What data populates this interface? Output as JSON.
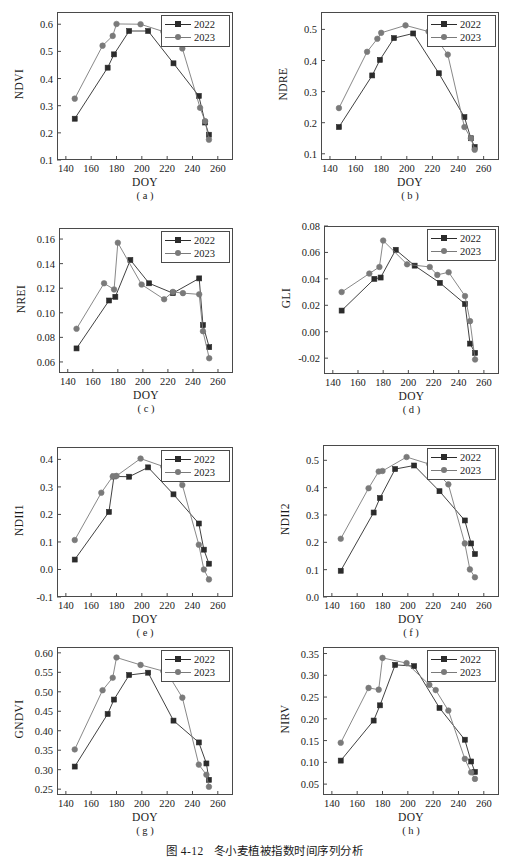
{
  "figure": {
    "caption_number": "图 4-12",
    "caption_text": "冬小麦植被指数时间序列分析",
    "xlabel": "DOY",
    "legend": {
      "series_2022": "2022",
      "series_2023": "2023"
    },
    "colors": {
      "series_2022": "#2b2b2b",
      "series_2023": "#7a7a7a",
      "axis": "#4a4a4a",
      "background": "#ffffff"
    }
  },
  "chart_data": [
    {
      "type": "line",
      "panel": "( a )",
      "title": "",
      "ylabel": "NDVI",
      "xlabel": "DOY",
      "xlim": [
        133,
        272
      ],
      "ylim": [
        0.1,
        0.645
      ],
      "xticks": [
        140,
        160,
        180,
        200,
        220,
        240,
        260
      ],
      "yticks": [
        0.1,
        0.2,
        0.3,
        0.4,
        0.5,
        0.6
      ],
      "ytick_labels": [
        "0.1",
        "0.2",
        "0.3",
        "0.4",
        "0.5",
        "0.6"
      ],
      "grid": false,
      "legend_position": "top-right",
      "series": [
        {
          "name": "2022",
          "marker": "square",
          "x": [
            147,
            173,
            178,
            190,
            205,
            225,
            245,
            250,
            253
          ],
          "values": [
            0.252,
            0.44,
            0.489,
            0.575,
            0.575,
            0.456,
            0.336,
            0.238,
            0.193
          ]
        },
        {
          "name": "2023",
          "marker": "circle",
          "x": [
            147,
            169,
            177,
            180,
            199,
            217,
            222,
            232,
            246,
            250,
            253
          ],
          "values": [
            0.326,
            0.521,
            0.557,
            0.601,
            0.6,
            0.573,
            0.559,
            0.511,
            0.292,
            0.243,
            0.175
          ]
        }
      ]
    },
    {
      "type": "line",
      "panel": "( b )",
      "title": "",
      "ylabel": "NDRE",
      "xlabel": "DOY",
      "xlim": [
        133,
        272
      ],
      "ylim": [
        0.08,
        0.556
      ],
      "xticks": [
        140,
        160,
        180,
        200,
        220,
        240,
        260
      ],
      "yticks": [
        0.1,
        0.2,
        0.3,
        0.4,
        0.5
      ],
      "ytick_labels": [
        "0.1",
        "0.2",
        "0.3",
        "0.4",
        "0.5"
      ],
      "grid": false,
      "legend_position": "top-right",
      "series": [
        {
          "name": "2022",
          "marker": "square",
          "x": [
            147,
            173,
            179,
            190,
            205,
            225,
            245,
            250,
            253
          ],
          "values": [
            0.186,
            0.352,
            0.402,
            0.472,
            0.487,
            0.359,
            0.218,
            0.15,
            0.122
          ]
        },
        {
          "name": "2023",
          "marker": "circle",
          "x": [
            147,
            169,
            177,
            180,
            199,
            217,
            222,
            232,
            245,
            250,
            253
          ],
          "values": [
            0.247,
            0.428,
            0.47,
            0.489,
            0.513,
            0.493,
            0.476,
            0.419,
            0.186,
            0.15,
            0.113
          ]
        }
      ]
    },
    {
      "type": "line",
      "panel": "( c )",
      "title": "",
      "ylabel": "NREI",
      "xlabel": "DOY",
      "xlim": [
        133,
        272
      ],
      "ylim": [
        0.051,
        0.169
      ],
      "xticks": [
        140,
        160,
        180,
        200,
        220,
        240,
        260
      ],
      "yticks": [
        0.06,
        0.08,
        0.1,
        0.12,
        0.14,
        0.16
      ],
      "ytick_labels": [
        "0.06",
        "0.08",
        "0.10",
        "0.12",
        "0.14",
        "0.16"
      ],
      "grid": false,
      "legend_position": "top-right",
      "series": [
        {
          "name": "2022",
          "marker": "square",
          "x": [
            147,
            173,
            178,
            190,
            205,
            224,
            245,
            248,
            253
          ],
          "values": [
            0.071,
            0.11,
            0.113,
            0.143,
            0.124,
            0.116,
            0.128,
            0.09,
            0.072
          ]
        },
        {
          "name": "2023",
          "marker": "circle",
          "x": [
            147,
            169,
            177,
            180,
            199,
            217,
            224,
            232,
            245,
            248,
            253
          ],
          "values": [
            0.087,
            0.124,
            0.119,
            0.157,
            0.123,
            0.111,
            0.117,
            0.116,
            0.115,
            0.085,
            0.063
          ]
        }
      ]
    },
    {
      "type": "line",
      "panel": "( d )",
      "title": "",
      "ylabel": "GLI",
      "xlabel": "DOY",
      "xlim": [
        133,
        272
      ],
      "ylim": [
        -0.032,
        0.08
      ],
      "xticks": [
        140,
        160,
        180,
        200,
        220,
        240,
        260
      ],
      "yticks": [
        -0.02,
        0.0,
        0.02,
        0.04,
        0.06,
        0.08
      ],
      "ytick_labels": [
        "-0.02",
        "0.00",
        "0.02",
        "0.04",
        "0.06",
        "0.08"
      ],
      "grid": false,
      "legend_position": "top-right",
      "series": [
        {
          "name": "2022",
          "marker": "square",
          "x": [
            147,
            173,
            178,
            190,
            205,
            225,
            245,
            249,
            253
          ],
          "values": [
            0.016,
            0.04,
            0.041,
            0.062,
            0.05,
            0.037,
            0.021,
            -0.009,
            -0.016
          ]
        },
        {
          "name": "2023",
          "marker": "circle",
          "x": [
            147,
            169,
            177,
            180,
            199,
            217,
            223,
            232,
            245,
            249,
            253
          ],
          "values": [
            0.03,
            0.044,
            0.049,
            0.069,
            0.051,
            0.049,
            0.043,
            0.045,
            0.027,
            0.008,
            -0.021
          ]
        }
      ]
    },
    {
      "type": "line",
      "panel": "( e )",
      "title": "",
      "ylabel": "NDII1",
      "xlabel": "DOY",
      "xlim": [
        133,
        272
      ],
      "ylim": [
        -0.1,
        0.445
      ],
      "xticks": [
        140,
        160,
        180,
        200,
        220,
        240,
        260
      ],
      "yticks": [
        -0.1,
        0.0,
        0.1,
        0.2,
        0.3,
        0.4
      ],
      "ytick_labels": [
        "-0.1",
        "0.0",
        "0.1",
        "0.2",
        "0.3",
        "0.4"
      ],
      "grid": false,
      "legend_position": "top-right",
      "series": [
        {
          "name": "2022",
          "marker": "square",
          "x": [
            147,
            174,
            178,
            190,
            205,
            225,
            245,
            249,
            253
          ],
          "values": [
            0.036,
            0.209,
            0.338,
            0.337,
            0.371,
            0.273,
            0.167,
            0.072,
            0.021
          ]
        },
        {
          "name": "2023",
          "marker": "circle",
          "x": [
            147,
            168,
            177,
            180,
            199,
            217,
            222,
            232,
            245,
            249,
            253
          ],
          "values": [
            0.107,
            0.279,
            0.338,
            0.34,
            0.403,
            0.374,
            0.358,
            0.307,
            0.09,
            0.0,
            -0.036
          ]
        }
      ]
    },
    {
      "type": "line",
      "panel": "( f )",
      "title": "",
      "ylabel": "NDII2",
      "xlabel": "DOY",
      "xlim": [
        133,
        272
      ],
      "ylim": [
        0.0,
        0.556
      ],
      "xticks": [
        140,
        160,
        180,
        200,
        220,
        240,
        260
      ],
      "yticks": [
        0.0,
        0.1,
        0.2,
        0.3,
        0.4,
        0.5
      ],
      "ytick_labels": [
        "0.0",
        "0.1",
        "0.2",
        "0.3",
        "0.4",
        "0.5"
      ],
      "grid": false,
      "legend_position": "top-right",
      "series": [
        {
          "name": "2022",
          "marker": "square",
          "x": [
            147,
            173,
            178,
            190,
            205,
            225,
            245,
            250,
            253
          ],
          "values": [
            0.096,
            0.309,
            0.362,
            0.468,
            0.481,
            0.387,
            0.28,
            0.196,
            0.157
          ]
        },
        {
          "name": "2023",
          "marker": "circle",
          "x": [
            147,
            169,
            177,
            180,
            199,
            217,
            222,
            232,
            245,
            249,
            253
          ],
          "values": [
            0.213,
            0.398,
            0.459,
            0.461,
            0.512,
            0.486,
            0.459,
            0.412,
            0.196,
            0.101,
            0.072
          ]
        }
      ]
    },
    {
      "type": "line",
      "panel": "( g )",
      "title": "",
      "ylabel": "GNDVI",
      "xlabel": "DOY",
      "xlim": [
        133,
        272
      ],
      "ylim": [
        0.235,
        0.615
      ],
      "xticks": [
        140,
        160,
        180,
        200,
        220,
        240,
        260
      ],
      "yticks": [
        0.25,
        0.3,
        0.35,
        0.4,
        0.45,
        0.5,
        0.55,
        0.6
      ],
      "ytick_labels": [
        "0.25",
        "0.30",
        "0.35",
        "0.40",
        "0.45",
        "0.50",
        "0.55",
        "0.60"
      ],
      "grid": false,
      "legend_position": "top-right",
      "series": [
        {
          "name": "2022",
          "marker": "square",
          "x": [
            147,
            173,
            178,
            190,
            205,
            225,
            245,
            251,
            253
          ],
          "values": [
            0.308,
            0.443,
            0.48,
            0.543,
            0.549,
            0.426,
            0.37,
            0.316,
            0.274
          ]
        },
        {
          "name": "2023",
          "marker": "circle",
          "x": [
            147,
            169,
            177,
            180,
            199,
            217,
            222,
            232,
            245,
            251,
            253
          ],
          "values": [
            0.352,
            0.504,
            0.536,
            0.588,
            0.569,
            0.553,
            0.538,
            0.485,
            0.313,
            0.287,
            0.256
          ]
        }
      ]
    },
    {
      "type": "line",
      "panel": "( h )",
      "title": "",
      "ylabel": "NIRV",
      "xlabel": "DOY",
      "xlim": [
        133,
        272
      ],
      "ylim": [
        0.025,
        0.365
      ],
      "xticks": [
        140,
        160,
        180,
        200,
        220,
        240,
        260
      ],
      "yticks": [
        0.05,
        0.1,
        0.15,
        0.2,
        0.25,
        0.3,
        0.35
      ],
      "ytick_labels": [
        "0.05",
        "0.10",
        "0.15",
        "0.20",
        "0.25",
        "0.30",
        "0.35"
      ],
      "grid": false,
      "legend_position": "top-right",
      "series": [
        {
          "name": "2022",
          "marker": "square",
          "x": [
            147,
            173,
            178,
            190,
            205,
            225,
            245,
            250,
            253
          ],
          "values": [
            0.104,
            0.196,
            0.231,
            0.324,
            0.321,
            0.225,
            0.152,
            0.102,
            0.078
          ]
        },
        {
          "name": "2023",
          "marker": "circle",
          "x": [
            147,
            169,
            177,
            180,
            199,
            217,
            222,
            232,
            245,
            250,
            253
          ],
          "values": [
            0.145,
            0.271,
            0.267,
            0.34,
            0.328,
            0.278,
            0.266,
            0.219,
            0.108,
            0.077,
            0.062
          ]
        }
      ]
    }
  ]
}
